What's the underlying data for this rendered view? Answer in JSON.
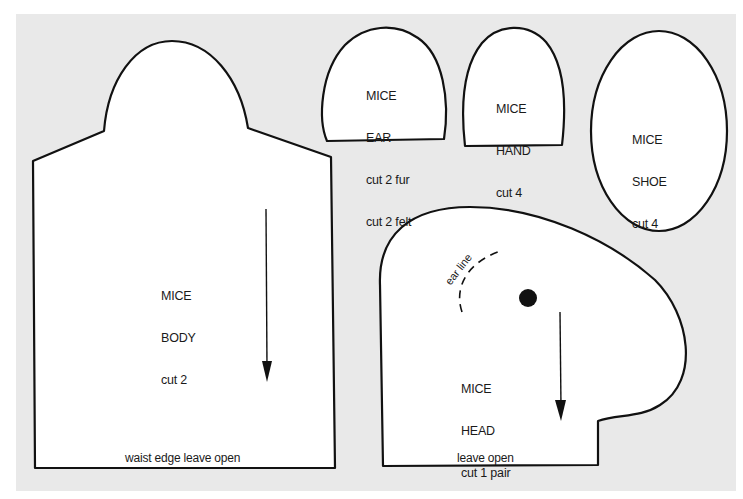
{
  "sheet": {
    "background_color": "#e9e9e9",
    "margin_color": "#ffffff",
    "outline_color": "#111111"
  },
  "pieces": {
    "body": {
      "name": "MICE",
      "part": "BODY",
      "instruction": "cut 2",
      "edge_note": "waist edge leave open",
      "grainline": "arrow-down"
    },
    "ear": {
      "name": "MICE",
      "part": "EAR",
      "instruction_1": "cut 2 fur",
      "instruction_2": "cut 2 felt"
    },
    "hand": {
      "name": "MICE",
      "part": "HAND",
      "instruction": "cut 4"
    },
    "shoe": {
      "name": "MICE",
      "part": "SHOE",
      "instruction": "cut 4"
    },
    "head": {
      "name": "MICE",
      "part": "HEAD",
      "instruction": "cut 1 pair",
      "edge_note": "leave open",
      "ear_line_label": "ear line",
      "eye_marker": "dot",
      "grainline": "arrow-down"
    }
  }
}
